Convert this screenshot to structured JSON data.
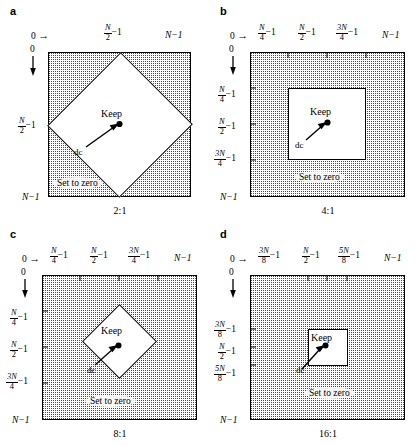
{
  "figure": {
    "panels": [
      {
        "letter": "a",
        "caption": "2:1",
        "keep_label": "Keep",
        "dc_label": "dc",
        "zero_label": "Set to zero",
        "keep_shape": "diamond",
        "top_axis": {
          "origin": "0",
          "arrow": "→",
          "ticks": [
            {
              "num": "N",
              "den": "2",
              "suffix": "−1"
            }
          ],
          "end": "N−1"
        },
        "left_axis": {
          "origin": "0",
          "arrow": "↓",
          "ticks": [
            {
              "num": "N",
              "den": "2",
              "suffix": "−1"
            }
          ],
          "end": "N−1"
        }
      },
      {
        "letter": "b",
        "caption": "4:1",
        "keep_label": "Keep",
        "dc_label": "dc",
        "zero_label": "Set to zero",
        "keep_shape": "square",
        "top_axis": {
          "origin": "0",
          "arrow": "→",
          "ticks": [
            {
              "num": "N",
              "den": "4",
              "suffix": "−1"
            },
            {
              "num": "N",
              "den": "2",
              "suffix": "−1"
            },
            {
              "num": "3N",
              "den": "4",
              "suffix": "−1"
            }
          ],
          "end": "N−1"
        },
        "left_axis": {
          "origin": "0",
          "arrow": "↓",
          "ticks": [
            {
              "num": "N",
              "den": "4",
              "suffix": "−1"
            },
            {
              "num": "N",
              "den": "2",
              "suffix": "−1"
            },
            {
              "num": "3N",
              "den": "4",
              "suffix": "−1"
            }
          ],
          "end": "N−1"
        }
      },
      {
        "letter": "c",
        "caption": "8:1",
        "keep_label": "Keep",
        "dc_label": "dc",
        "zero_label": "Set to zero",
        "keep_shape": "diamond",
        "top_axis": {
          "origin": "0",
          "arrow": "→",
          "ticks": [
            {
              "num": "N",
              "den": "4",
              "suffix": "−1"
            },
            {
              "num": "N",
              "den": "2",
              "suffix": "−1"
            },
            {
              "num": "3N",
              "den": "4",
              "suffix": "−1"
            }
          ],
          "end": "N−1"
        },
        "left_axis": {
          "origin": "0",
          "arrow": "↓",
          "ticks": [
            {
              "num": "N",
              "den": "4",
              "suffix": "−1"
            },
            {
              "num": "N",
              "den": "2",
              "suffix": "−1"
            },
            {
              "num": "3N",
              "den": "4",
              "suffix": "−1"
            }
          ],
          "end": "N−1"
        }
      },
      {
        "letter": "d",
        "caption": "16:1",
        "keep_label": "Keep",
        "dc_label": "dc",
        "zero_label": "Set to zero",
        "keep_shape": "square",
        "top_axis": {
          "origin": "0",
          "arrow": "→",
          "ticks": [
            {
              "num": "3N",
              "den": "8",
              "suffix": "−1"
            },
            {
              "num": "N",
              "den": "2",
              "suffix": "−1"
            },
            {
              "num": "5N",
              "den": "8",
              "suffix": "−1"
            }
          ],
          "end": "N−1"
        },
        "left_axis": {
          "origin": "0",
          "arrow": "↓",
          "ticks": [
            {
              "num": "3N",
              "den": "8",
              "suffix": "−1"
            },
            {
              "num": "N",
              "den": "2",
              "suffix": "−1"
            },
            {
              "num": "5N",
              "den": "8",
              "suffix": "−1"
            }
          ],
          "end": "N−1"
        }
      }
    ],
    "colors": {
      "line": "#000000",
      "stipple": "#4a4a4a",
      "background": "#ffffff"
    }
  }
}
